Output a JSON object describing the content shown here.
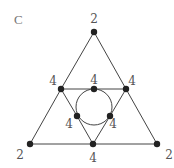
{
  "panel_label": "C",
  "colors": {
    "edge": "#444444",
    "node": "#222222",
    "label": "#555555"
  },
  "nodes": [
    {
      "id": "top",
      "x": 94,
      "y": 32,
      "label": "2",
      "lx": 94,
      "ly": 23
    },
    {
      "id": "mid-left",
      "x": 61,
      "y": 89,
      "label": "4",
      "lx": 53,
      "ly": 85
    },
    {
      "id": "mid-center",
      "x": 94,
      "y": 89,
      "label": "4",
      "lx": 94,
      "ly": 84
    },
    {
      "id": "mid-right",
      "x": 126,
      "y": 89,
      "label": "4",
      "lx": 132,
      "ly": 85
    },
    {
      "id": "inner-left",
      "x": 77,
      "y": 116,
      "label": "4",
      "lx": 69,
      "ly": 128
    },
    {
      "id": "inner-right",
      "x": 110,
      "y": 116,
      "label": "4",
      "lx": 113,
      "ly": 128
    },
    {
      "id": "bottom-left",
      "x": 30,
      "y": 144,
      "label": "2",
      "lx": 20,
      "ly": 159
    },
    {
      "id": "bottom-center",
      "x": 93,
      "y": 144,
      "label": "4",
      "lx": 93,
      "ly": 162
    },
    {
      "id": "bottom-right",
      "x": 157,
      "y": 144,
      "label": "2",
      "lx": 169,
      "ly": 159
    }
  ],
  "edges": [
    [
      "top",
      "mid-left"
    ],
    [
      "mid-left",
      "bottom-left"
    ],
    [
      "top",
      "mid-right"
    ],
    [
      "mid-right",
      "bottom-right"
    ],
    [
      "bottom-left",
      "bottom-center"
    ],
    [
      "bottom-center",
      "bottom-right"
    ],
    [
      "mid-left",
      "mid-center"
    ],
    [
      "mid-center",
      "mid-right"
    ],
    [
      "mid-left",
      "inner-left"
    ],
    [
      "inner-left",
      "bottom-center"
    ],
    [
      "mid-right",
      "inner-right"
    ],
    [
      "inner-right",
      "bottom-center"
    ]
  ],
  "circle": {
    "cx": 94,
    "cy": 107,
    "r": 18
  }
}
